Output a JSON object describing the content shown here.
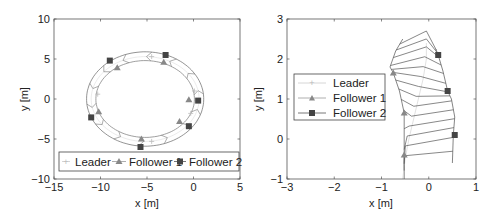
{
  "chart_data": [
    {
      "type": "line",
      "name": "formation-circle",
      "xlabel": "x [m]",
      "ylabel": "y [m]",
      "xlim": [
        -15,
        5
      ],
      "ylim": [
        -10,
        10
      ],
      "xticks": [
        -15,
        -10,
        -5,
        0,
        5
      ],
      "yticks": [
        -10,
        -5,
        0,
        5,
        10
      ],
      "xtick_labels": [
        "−15",
        "−10",
        "−5",
        "0",
        "5"
      ],
      "ytick_labels": [
        "−10",
        "−5",
        "0",
        "5",
        "10"
      ],
      "grid": false,
      "legend": {
        "placement": "bottom",
        "orientation": "horizontal",
        "entries": [
          "Leader",
          "Follower 1",
          "Follower 2"
        ]
      },
      "path": {
        "center": [
          -5.2,
          0
        ],
        "leader_radius_x": 5.8,
        "leader_radius_y": 5.3,
        "follower1_radius_x": 5.3,
        "follower1_radius_y": 4.8,
        "follower2_radius_x": 6.3,
        "follower2_radius_y": 5.9,
        "start_angle_deg": -40,
        "end_angle_deg": 320
      },
      "series": [
        {
          "name": "Leader",
          "marker": "plus",
          "color": "#bbbbbb",
          "points": [
            [
              0.1,
              1.0
            ],
            [
              -4.5,
              5.3
            ],
            [
              -10.3,
              0.6
            ],
            [
              -4.5,
              -5.3
            ],
            [
              -0.3,
              -1.8
            ]
          ]
        },
        {
          "name": "Follower 1",
          "marker": "triangle",
          "color": "#888888",
          "points": [
            [
              -8.2,
              3.9
            ],
            [
              -3.2,
              4.6
            ],
            [
              -0.5,
              -0.1
            ],
            [
              -1.5,
              -2.8
            ],
            [
              -5.6,
              -5.0
            ],
            [
              -10.2,
              -1.6
            ]
          ]
        },
        {
          "name": "Follower 2",
          "marker": "square",
          "color": "#444444",
          "points": [
            [
              -9.0,
              4.8
            ],
            [
              -3.0,
              5.5
            ],
            [
              0.5,
              -0.2
            ],
            [
              -0.5,
              -3.4
            ],
            [
              -5.7,
              -6.0
            ],
            [
              -11.0,
              -2.3
            ]
          ]
        }
      ]
    },
    {
      "type": "line",
      "name": "formation-zoom",
      "xlabel": "x [m]",
      "ylabel": "y [m]",
      "xlim": [
        -3,
        1
      ],
      "ylim": [
        -1,
        3
      ],
      "xticks": [
        -3,
        -2,
        -1,
        0,
        1
      ],
      "yticks": [
        -1,
        0,
        1,
        2,
        3
      ],
      "xtick_labels": [
        "−3",
        "−2",
        "−1",
        "0",
        "1"
      ],
      "ytick_labels": [
        "−1",
        "0",
        "1",
        "2",
        "3"
      ],
      "grid": false,
      "legend": {
        "placement": "center-left",
        "orientation": "vertical",
        "entries": [
          "Leader",
          "Follower 1",
          "Follower 2"
        ]
      },
      "series": [
        {
          "name": "Leader",
          "marker": "plus",
          "color": "#bbbbbb",
          "points": [
            [
              -0.55,
              -1.0
            ],
            [
              -0.5,
              -0.5
            ],
            [
              -0.42,
              0.0
            ],
            [
              -0.32,
              0.5
            ],
            [
              -0.22,
              1.0
            ],
            [
              -0.12,
              1.5
            ],
            [
              -0.05,
              2.0
            ],
            [
              -0.05,
              2.4
            ]
          ]
        },
        {
          "name": "Follower 1",
          "marker": "triangle",
          "color": "#888888",
          "points": [
            [
              -0.52,
              -1.0
            ],
            [
              -0.52,
              -0.4
            ],
            [
              -0.52,
              0.65
            ],
            [
              -0.62,
              1.2
            ],
            [
              -0.75,
              1.65
            ],
            [
              -0.82,
              1.8
            ],
            [
              -0.7,
              2.2
            ],
            [
              -0.55,
              2.5
            ]
          ]
        },
        {
          "name": "Follower 2",
          "marker": "square",
          "color": "#444444",
          "points": [
            [
              0.5,
              -0.6
            ],
            [
              0.52,
              0.1
            ],
            [
              0.55,
              0.55
            ],
            [
              0.48,
              1.0
            ],
            [
              0.4,
              1.2
            ],
            [
              0.3,
              1.7
            ],
            [
              0.2,
              2.1
            ],
            [
              0.15,
              2.25
            ]
          ]
        }
      ],
      "chevron_count": 14
    }
  ]
}
